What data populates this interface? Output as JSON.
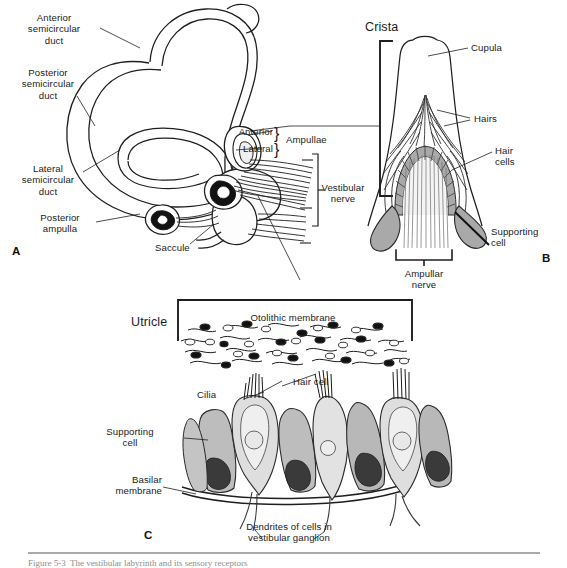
{
  "figure": {
    "caption_partial": "Figure 5-3  The vestibular labyrinth and its sensory receptors"
  },
  "panels": [
    {
      "id": "A",
      "letter": "A",
      "name": "vestibular-labyrinth",
      "labels": [
        "Anterior\nsemicircular\nduct",
        "Posterior\nsemicircular\nduct",
        "Lateral\nsemicircular\nduct",
        "Posterior\nampulla",
        "Saccule",
        "Anterior",
        "Lateral",
        "Ampullae",
        "Vestibular\nnerve"
      ]
    },
    {
      "id": "B",
      "letter": "B",
      "name": "crista-ampullaris",
      "labels": [
        "Crista",
        "Cupula",
        "Hairs",
        "Hair\ncells",
        "Supporting\ncell",
        "Ampullar\nnerve"
      ]
    },
    {
      "id": "C",
      "letter": "C",
      "name": "utricular-macula",
      "labels": [
        "Utricle",
        "Otolithic membrane",
        "Cilia",
        "Hair cell",
        "Supporting\ncell",
        "Basilar\nmembrane",
        "Dendrites of cells in\nvestibular ganglion"
      ]
    }
  ],
  "panelA": {
    "letter": "A",
    "anterior_duct": "Anterior\nsemicircular\nduct",
    "posterior_duct": "Posterior\nsemicircular\nduct",
    "lateral_duct": "Lateral\nsemicircular\nduct",
    "posterior_ampulla": "Posterior\nampulla",
    "saccule": "Saccule",
    "ampulla_anterior": "Anterior",
    "ampulla_lateral": "Lateral",
    "ampullae": "Ampullae",
    "vestibular_nerve": "Vestibular\nnerve"
  },
  "panelB": {
    "letter": "B",
    "crista": "Crista",
    "cupula": "Cupula",
    "hairs": "Hairs",
    "hair_cells": "Hair\ncells",
    "supporting_cell": "Supporting\ncell",
    "ampullar_nerve": "Ampullar\nnerve"
  },
  "panelC": {
    "letter": "C",
    "utricle": "Utricle",
    "otolithic_membrane": "Otolithic membrane",
    "cilia": "Cilia",
    "hair_cell": "Hair cell",
    "supporting_cell": "Supporting\ncell",
    "basilar_membrane": "Basilar\nmembrane",
    "dendrites": "Dendrites of cells in\nvestibular ganglion"
  },
  "colors": {
    "ink": "#1a1a1a",
    "stroke": "#222222",
    "cell_gray_light": "#d6d6d6",
    "cell_gray_mid": "#b5b5b5",
    "cell_gray_dark": "#9a9a9a",
    "nucleus_dark": "#3a3a3a",
    "background": "#ffffff",
    "rule_gray": "#a9a9a9",
    "caption_gray": "#8d8d8d"
  }
}
